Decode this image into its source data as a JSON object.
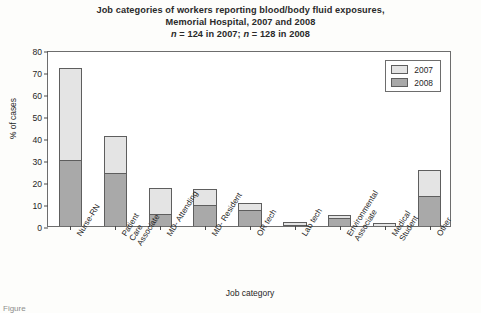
{
  "figure": {
    "title_lines": [
      "Job categories of workers reporting blood/body fluid exposures,",
      "Memorial Hospital, 2007 and 2008"
    ],
    "subtitle": "n = 124 in 2007; n = 128 in 2008",
    "caption": "Figure"
  },
  "legend": {
    "position": "top-right",
    "entries": [
      {
        "label": "2007",
        "color": "#e4e4e4"
      },
      {
        "label": "2008",
        "color": "#a9a9a9"
      }
    ]
  },
  "chart_data": {
    "type": "bar",
    "stacked": true,
    "title": "Job categories of workers reporting blood/body fluid exposures, Memorial Hospital, 2007 and 2008",
    "subtitle": "n = 124 in 2007; n = 128 in 2008",
    "xlabel": "Job category",
    "ylabel": "% of cases",
    "ylim": [
      0,
      80
    ],
    "yticks": [
      0,
      10,
      20,
      30,
      40,
      50,
      60,
      70,
      80
    ],
    "grid": false,
    "legend_position": "top-right",
    "categories": [
      "Nurse-RN",
      "Patient Care Associate",
      "MD- Attending",
      "MD- Resident",
      "OR tech",
      "Lab tech",
      "Environmental Associate",
      "Medical Student",
      "Other"
    ],
    "series": [
      {
        "name": "2008",
        "color": "#a9a9a9",
        "values": [
          30,
          24,
          5.5,
          9.5,
          7.5,
          0.5,
          3.5,
          0,
          13.5
        ]
      },
      {
        "name": "2007",
        "color": "#e4e4e4",
        "values": [
          42,
          17,
          12,
          7.5,
          3,
          1.5,
          1.5,
          1.5,
          12
        ]
      }
    ],
    "totals": [
      72,
      41,
      17.5,
      17,
      10.5,
      2,
      5,
      1.5,
      25.5
    ]
  }
}
